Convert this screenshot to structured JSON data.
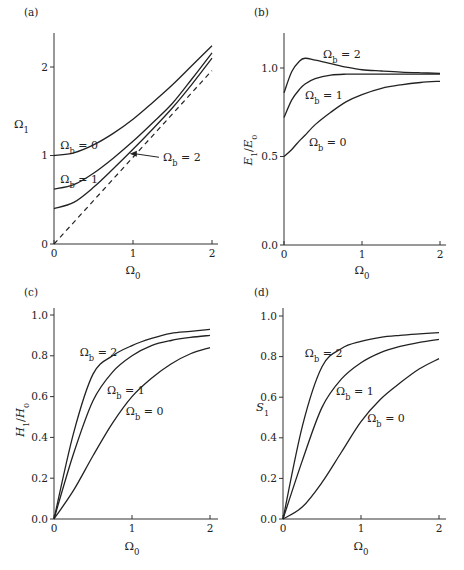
{
  "figure": {
    "width": 464,
    "height": 570,
    "background": "#ffffff",
    "line_color": "#222222"
  },
  "chart_data": [
    {
      "id": "a",
      "type": "line",
      "panel_label": "(a)",
      "title": "",
      "xlabel": "Ω0",
      "ylabel": "Ω1",
      "xlim": [
        0,
        2
      ],
      "ylim": [
        0,
        2.4
      ],
      "xticks": [
        0,
        1,
        2
      ],
      "xtick_labels": [
        "0",
        "1",
        "2"
      ],
      "yticks": [
        0,
        1,
        2
      ],
      "ytick_labels": [
        "0",
        "1",
        "2"
      ],
      "grid": false,
      "legend": "inline labels",
      "x": [
        0,
        0.25,
        0.5,
        0.75,
        1.0,
        1.25,
        1.5,
        1.75,
        2.0
      ],
      "series": [
        {
          "name": "Ωb = 0",
          "values": [
            1.0,
            1.03,
            1.12,
            1.25,
            1.41,
            1.6,
            1.8,
            2.02,
            2.24
          ]
        },
        {
          "name": "Ωb = 1",
          "values": [
            0.62,
            0.67,
            0.8,
            0.97,
            1.16,
            1.37,
            1.59,
            1.87,
            2.16
          ]
        },
        {
          "name": "Ωb = 2",
          "values": [
            0.4,
            0.47,
            0.64,
            0.85,
            1.07,
            1.3,
            1.54,
            1.81,
            2.1
          ]
        },
        {
          "name": "Ω1 = Ω0 (dashed)",
          "style": "dashed",
          "values": [
            0,
            0.25,
            0.5,
            0.75,
            1.0,
            1.25,
            1.5,
            1.75,
            1.96
          ]
        }
      ],
      "annotations": [
        {
          "text": "Ωb = 0",
          "x": 0.08,
          "y": 1.12
        },
        {
          "text": "Ωb = 1",
          "x": 0.08,
          "y": 0.73
        },
        {
          "text": "Ωb = 2",
          "x": 1.38,
          "y": 0.98,
          "arrow_to": [
            0.96,
            1.02
          ]
        }
      ]
    },
    {
      "id": "b",
      "type": "line",
      "panel_label": "(b)",
      "title": "",
      "xlabel": "Ω0",
      "ylabel": "E1/E0",
      "xlim": [
        0,
        2
      ],
      "ylim": [
        0,
        1.2
      ],
      "xticks": [
        0,
        1,
        2
      ],
      "xtick_labels": [
        "0",
        "1",
        "2"
      ],
      "yticks": [
        0,
        0.5,
        1.0
      ],
      "ytick_labels": [
        "0.0",
        "0.5",
        "1.0"
      ],
      "grid": false,
      "legend": "inline labels",
      "x": [
        0,
        0.1,
        0.2,
        0.27,
        0.4,
        0.6,
        0.8,
        1.0,
        1.25,
        1.5,
        1.75,
        2.0
      ],
      "series": [
        {
          "name": "Ωb = 0",
          "values": [
            0.5,
            0.54,
            0.59,
            0.62,
            0.68,
            0.75,
            0.81,
            0.85,
            0.885,
            0.905,
            0.918,
            0.925
          ]
        },
        {
          "name": "Ωb = 1",
          "values": [
            0.72,
            0.82,
            0.88,
            0.91,
            0.94,
            0.96,
            0.965,
            0.965,
            0.965,
            0.965,
            0.965,
            0.965
          ]
        },
        {
          "name": "Ωb = 2",
          "values": [
            0.86,
            0.98,
            1.04,
            1.055,
            1.045,
            1.025,
            1.005,
            0.99,
            0.983,
            0.977,
            0.973,
            0.97
          ]
        }
      ],
      "annotations": [
        {
          "text": "Ωb = 2",
          "x": 0.5,
          "y": 1.08
        },
        {
          "text": "Ωb = 1",
          "x": 0.27,
          "y": 0.85
        },
        {
          "text": "Ωb = 0",
          "x": 0.32,
          "y": 0.58
        }
      ]
    },
    {
      "id": "c",
      "type": "line",
      "panel_label": "(c)",
      "title": "",
      "xlabel": "Ω0",
      "ylabel": "H1/H0",
      "xlim": [
        0,
        2
      ],
      "ylim": [
        0,
        1.0
      ],
      "xticks": [
        0,
        1,
        2
      ],
      "xtick_labels": [
        "0",
        "1",
        "2"
      ],
      "yticks": [
        0,
        0.2,
        0.4,
        0.6,
        0.8,
        1.0
      ],
      "ytick_labels": [
        "0.0",
        "0.2",
        "0.4",
        "0.6",
        "0.8",
        "1.0"
      ],
      "grid": false,
      "legend": "inline labels",
      "x": [
        0,
        0.25,
        0.5,
        0.75,
        1.0,
        1.25,
        1.5,
        1.75,
        2.0
      ],
      "series": [
        {
          "name": "Ωb = 0",
          "values": [
            0,
            0.14,
            0.31,
            0.47,
            0.6,
            0.69,
            0.76,
            0.81,
            0.84
          ]
        },
        {
          "name": "Ωb = 1",
          "values": [
            0,
            0.32,
            0.58,
            0.72,
            0.8,
            0.85,
            0.875,
            0.89,
            0.9
          ]
        },
        {
          "name": "Ωb = 2",
          "values": [
            0,
            0.42,
            0.71,
            0.8,
            0.85,
            0.885,
            0.91,
            0.92,
            0.93
          ]
        }
      ],
      "annotations": [
        {
          "text": "Ωb = 2",
          "x": 0.33,
          "y": 0.82
        },
        {
          "text": "Ωb = 1",
          "x": 0.68,
          "y": 0.63
        },
        {
          "text": "Ωb = 0",
          "x": 0.92,
          "y": 0.53
        }
      ]
    },
    {
      "id": "d",
      "type": "line",
      "panel_label": "(d)",
      "title": "",
      "xlabel": "Ω0",
      "ylabel": "S1",
      "xlim": [
        0,
        2
      ],
      "ylim": [
        0,
        1.0
      ],
      "xticks": [
        0,
        1,
        2
      ],
      "xtick_labels": [
        "0",
        "1",
        "2"
      ],
      "yticks": [
        0,
        0.2,
        0.4,
        0.6,
        0.8,
        1.0
      ],
      "ytick_labels": [
        "0.0",
        "0.2",
        "0.4",
        "0.6",
        "0.8",
        "1.0"
      ],
      "grid": false,
      "legend": "inline labels",
      "x": [
        0,
        0.25,
        0.5,
        0.75,
        1.0,
        1.25,
        1.5,
        1.75,
        2.0
      ],
      "series": [
        {
          "name": "Ωb = 0",
          "values": [
            0,
            0.06,
            0.18,
            0.33,
            0.48,
            0.59,
            0.67,
            0.74,
            0.79
          ]
        },
        {
          "name": "Ωb = 1",
          "values": [
            0,
            0.29,
            0.55,
            0.69,
            0.77,
            0.82,
            0.85,
            0.87,
            0.885
          ]
        },
        {
          "name": "Ωb = 2",
          "values": [
            0,
            0.46,
            0.75,
            0.84,
            0.875,
            0.895,
            0.905,
            0.912,
            0.918
          ]
        }
      ],
      "annotations": [
        {
          "text": "Ωb = 2",
          "x": 0.28,
          "y": 0.82
        },
        {
          "text": "Ωb = 1",
          "x": 0.68,
          "y": 0.63
        },
        {
          "text": "Ωb = 0",
          "x": 1.08,
          "y": 0.5
        }
      ]
    }
  ]
}
